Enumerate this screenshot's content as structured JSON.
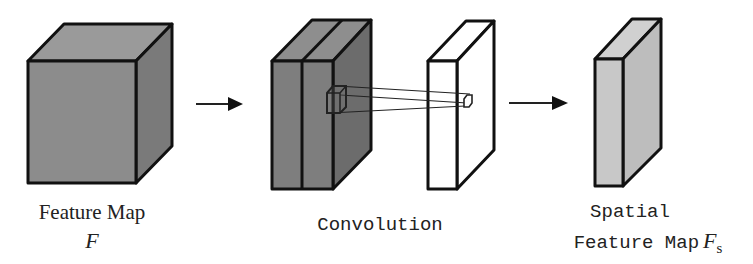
{
  "diagram": {
    "colors": {
      "stroke": "#111111",
      "feature_front": "#8c8c8c",
      "feature_top": "#9a9a9a",
      "feature_side": "#7a7a7a",
      "conv_front": "#7e7e7e",
      "conv_top": "#8e8e8e",
      "conv_side": "#6c6c6c",
      "output_fill": "#ffffff",
      "spatial_fill": "#c8c8c8",
      "spatial_top": "#d0d0d0",
      "spatial_side": "#bdbdbd"
    },
    "nodes": [
      {
        "id": "feature-map",
        "label": "Feature Map",
        "symbol": "F"
      },
      {
        "id": "convolution",
        "label": "Convolution"
      },
      {
        "id": "spatial-feature-map",
        "label_line1": "Spatial",
        "label_line2": "Feature Map",
        "symbol": "F",
        "subscript": "s"
      }
    ],
    "edges": [
      {
        "from": "feature-map",
        "to": "convolution"
      },
      {
        "from": "convolution",
        "to": "spatial-feature-map"
      }
    ]
  }
}
